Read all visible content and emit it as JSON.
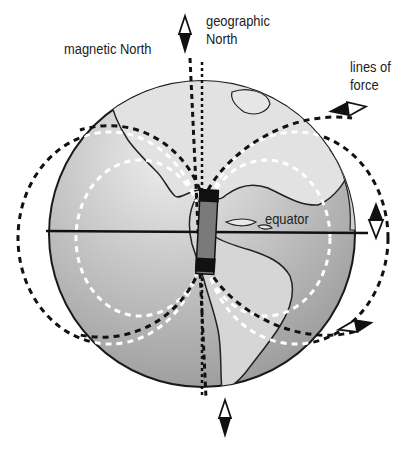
{
  "diagram": {
    "labels": {
      "magnetic_north": "magnetic North",
      "geographic_north_line1": "geographic",
      "geographic_north_line2": "North",
      "lines_of_force_line1": "lines of",
      "lines_of_force_line2": "force",
      "equator": "equator"
    },
    "elements": {
      "globe": "Earth globe showing the Americas",
      "bar_magnet": "bar magnet inside Earth",
      "compass_needles": 4
    },
    "colors": {
      "globe_fill": "#b9b9b9",
      "globe_highlight": "#e6e6e6",
      "outline": "#1a1a1a",
      "magnet_body": "#7a7a7a",
      "magnet_poles": "#111111",
      "background": "#ffffff"
    }
  }
}
